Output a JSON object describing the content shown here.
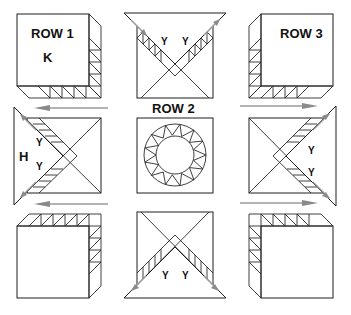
{
  "diagram": {
    "type": "quilt-block-assembly",
    "labels": {
      "row1": "ROW 1",
      "row2": "ROW 2",
      "row3": "ROW 3",
      "k": "K",
      "h": "H",
      "y": "Y"
    },
    "units": [
      {
        "position": "top-left",
        "label": "ROW 1",
        "sub_label": "K",
        "kind": "corner-square-with-strips"
      },
      {
        "position": "top-center",
        "label": "",
        "sub_label": "Y Y",
        "kind": "square-with-setting-triangle"
      },
      {
        "position": "top-right",
        "label": "ROW 3",
        "kind": "corner-square-with-strips"
      },
      {
        "position": "middle-left",
        "sub_label": "H / Y / Y",
        "kind": "square-with-setting-triangle"
      },
      {
        "position": "middle-center",
        "label": "ROW 2",
        "kind": "center-ring-square"
      },
      {
        "position": "middle-right",
        "sub_label": "Y / Y",
        "kind": "square-with-setting-triangle"
      },
      {
        "position": "bottom-left",
        "kind": "corner-square-with-strips"
      },
      {
        "position": "bottom-center",
        "sub_label": "Y Y",
        "kind": "square-with-setting-triangle"
      },
      {
        "position": "bottom-right",
        "kind": "corner-square-with-strips"
      }
    ],
    "colors": {
      "line": "#2a2a2a",
      "arrow": "#9a9a9a",
      "background": "#ffffff"
    }
  }
}
